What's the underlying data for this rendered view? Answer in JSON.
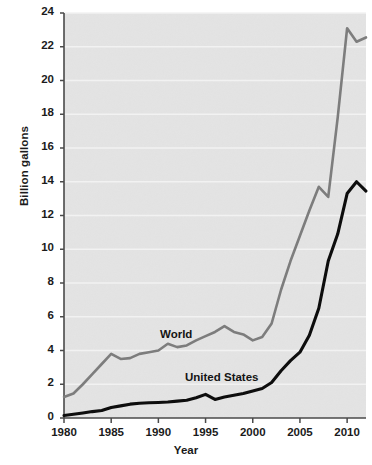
{
  "chart_data": {
    "type": "line",
    "title": "",
    "xlabel": "Year",
    "ylabel": "Billion gallons",
    "xlim": [
      1980,
      2012
    ],
    "ylim": [
      0,
      24
    ],
    "x_ticks": [
      1980,
      1985,
      1990,
      1995,
      2000,
      2005,
      2010
    ],
    "y_ticks": [
      0,
      2,
      4,
      6,
      8,
      10,
      12,
      14,
      16,
      18,
      20,
      22,
      24
    ],
    "grid": true,
    "grid_orientation": "horizontal",
    "legend_position": "inline-annotation",
    "x": [
      1980,
      1981,
      1982,
      1983,
      1984,
      1985,
      1986,
      1987,
      1988,
      1989,
      1990,
      1991,
      1992,
      1993,
      1994,
      1995,
      1996,
      1997,
      1998,
      1999,
      2000,
      2001,
      2002,
      2003,
      2004,
      2005,
      2006,
      2007,
      2008,
      2009,
      2010,
      2011,
      2012
    ],
    "series": [
      {
        "name": "World",
        "color": "#7d7d7d",
        "values": [
          1.25,
          1.45,
          2.0,
          2.6,
          3.2,
          3.8,
          3.5,
          3.55,
          3.8,
          3.9,
          4.0,
          4.4,
          4.2,
          4.3,
          4.6,
          4.85,
          5.1,
          5.45,
          5.1,
          4.95,
          4.6,
          4.8,
          5.6,
          7.6,
          9.3,
          10.8,
          12.3,
          13.7,
          13.1,
          17.8,
          23.1,
          22.3,
          22.55
        ]
      },
      {
        "name": "United States",
        "color": "#0d0d0d",
        "values": [
          0.15,
          0.22,
          0.3,
          0.38,
          0.44,
          0.62,
          0.72,
          0.82,
          0.87,
          0.9,
          0.92,
          0.95,
          1.0,
          1.05,
          1.2,
          1.4,
          1.1,
          1.25,
          1.35,
          1.45,
          1.6,
          1.75,
          2.1,
          2.8,
          3.4,
          3.9,
          4.9,
          6.5,
          9.3,
          10.9,
          13.3,
          14.0,
          13.45
        ]
      }
    ],
    "annotations": [
      {
        "text": "World",
        "x_pixel": 160,
        "y_pixel": 328
      },
      {
        "text": "United States",
        "x_pixel": 185,
        "y_pixel": 371
      }
    ]
  },
  "axis": {
    "y_title": "Billion gallons",
    "x_title": "Year",
    "y_tick_labels": [
      "24",
      "22",
      "20",
      "18",
      "16",
      "14",
      "12",
      "10",
      "8",
      "6",
      "4",
      "2",
      "0"
    ],
    "x_tick_labels": [
      "1980",
      "1985",
      "1990",
      "1995",
      "2000",
      "2005",
      "2010"
    ]
  },
  "colors": {
    "plot_background": "#e4e4e4",
    "gridline": "#f2f2f2",
    "axis_line": "#4a4a4a",
    "world_line": "#7d7d7d",
    "us_line": "#0d0d0d",
    "text": "#1b1b1b"
  }
}
